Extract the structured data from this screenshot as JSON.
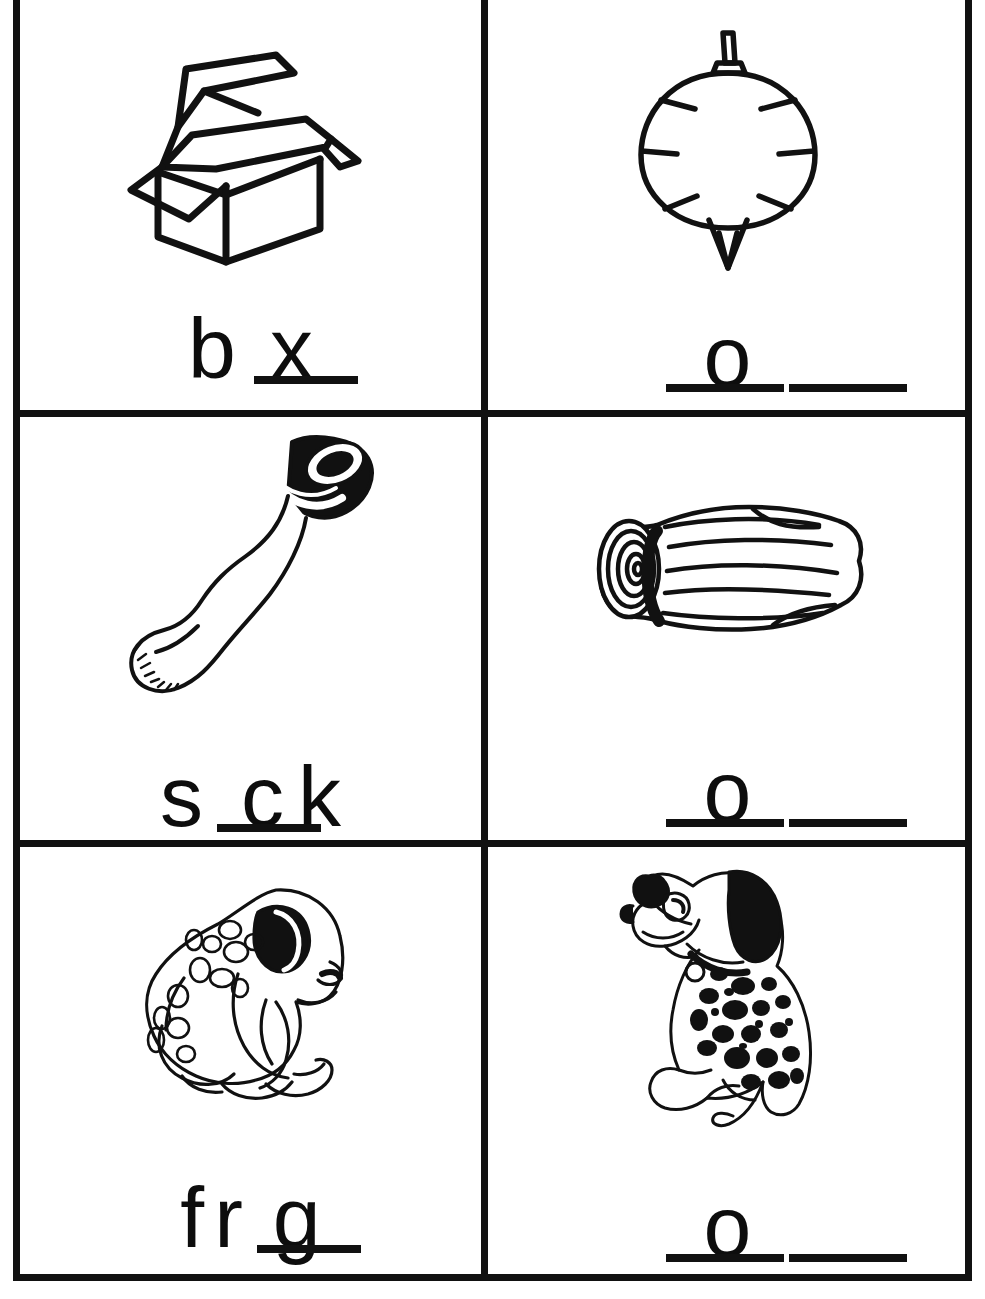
{
  "worksheet": {
    "title": "Short o Fill-in-the-Blank Picture Worksheet",
    "ink_color": "#111111",
    "paper_color": "#ffffff",
    "grid": {
      "columns": 2,
      "rows": 3,
      "border_color": "#111111"
    }
  },
  "cells": [
    {
      "id": "cell-box",
      "picture": "open-cardboard-box",
      "answer_word": "box",
      "pattern": "b _ x",
      "segments": [
        {
          "type": "letter",
          "text": "b"
        },
        {
          "type": "blank",
          "size": "mid"
        },
        {
          "type": "letter",
          "text": "x"
        }
      ]
    },
    {
      "id": "cell-top",
      "picture": "spinning-top",
      "answer_word": "top",
      "pattern": "_ o _",
      "segments": [
        {
          "type": "blank",
          "size": "side"
        },
        {
          "type": "letter",
          "text": "o"
        },
        {
          "type": "blank",
          "size": "side"
        }
      ]
    },
    {
      "id": "cell-sock",
      "picture": "sock",
      "answer_word": "sock",
      "pattern": "s _ c k",
      "segments": [
        {
          "type": "letter",
          "text": "s"
        },
        {
          "type": "blank",
          "size": "mid"
        },
        {
          "type": "letter",
          "text": "c"
        },
        {
          "type": "letter",
          "text": "k"
        }
      ]
    },
    {
      "id": "cell-log",
      "picture": "log",
      "answer_word": "log",
      "pattern": "_ o _",
      "segments": [
        {
          "type": "blank",
          "size": "side"
        },
        {
          "type": "letter",
          "text": "o"
        },
        {
          "type": "blank",
          "size": "side"
        }
      ]
    },
    {
      "id": "cell-frog",
      "picture": "frog",
      "answer_word": "frog",
      "pattern": "f r _ g",
      "segments": [
        {
          "type": "letter",
          "text": "f"
        },
        {
          "type": "letter",
          "text": "r"
        },
        {
          "type": "blank",
          "size": "mid"
        },
        {
          "type": "letter",
          "text": "g"
        }
      ]
    },
    {
      "id": "cell-dog",
      "picture": "dalmatian-dog",
      "answer_word": "dog",
      "pattern": "_ o _",
      "segments": [
        {
          "type": "blank",
          "size": "side"
        },
        {
          "type": "letter",
          "text": "o"
        },
        {
          "type": "blank",
          "size": "side"
        }
      ]
    }
  ],
  "letters": {
    "box_b": "b",
    "box_x": "x",
    "top_o": "o",
    "sock_s": "s",
    "sock_c": "c",
    "sock_k": "k",
    "log_o": "o",
    "frog_f": "f",
    "frog_r": "r",
    "frog_g": "g",
    "dog_o": "o"
  }
}
